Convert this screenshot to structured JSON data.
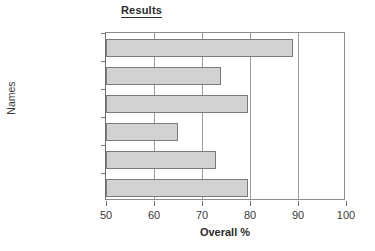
{
  "chart_data": {
    "type": "bar",
    "orientation": "horizontal",
    "title": "Results",
    "xlabel": "Overall %",
    "ylabel": "Names",
    "categories": [
      "Smithson",
      "Hardacre",
      "George",
      "Fuller",
      "Renshaw",
      "Jameson"
    ],
    "values": [
      89,
      74,
      79.5,
      65,
      73,
      79.5
    ],
    "xlim": [
      50,
      100
    ],
    "xticks": [
      50,
      60,
      70,
      80,
      90,
      100
    ],
    "xticklabels": [
      "50",
      "60",
      "70",
      "80",
      "90",
      "100"
    ],
    "grid": "vertical",
    "legend": "none",
    "bar_fill": "#d2d2d2",
    "bar_stroke": "#7b7b7b",
    "axis_color": "#6e6e6e",
    "grid_color": "#9a9a9a",
    "text_color": "#3a3a3a"
  }
}
